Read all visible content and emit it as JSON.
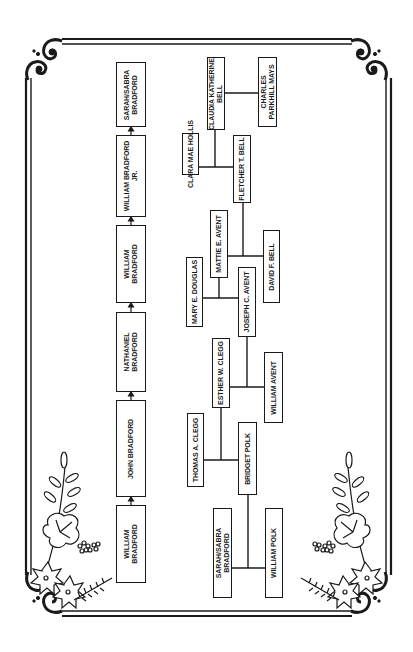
{
  "lineage_chain": {
    "direction": "bottom-to-top",
    "items": [
      {
        "label": "WILLIAM\nBRADFORD"
      },
      {
        "label": "JOHN BRADFORD"
      },
      {
        "label": "NATHANIEL\nBRADFORD"
      },
      {
        "label": "WILLIAM\nBRADFORD"
      },
      {
        "label": "WILLIAM BRADFORD\nJR."
      },
      {
        "label": "SARAH/SABRA\nBRADFORD"
      }
    ]
  },
  "family_tree": {
    "people": {
      "clara_mae_hollis": "CLARA MAE HOLLIS",
      "claudia_katherine_bell": "CLAUDIA KATHERINE\nBELL",
      "charles_parkhill_mays": "CHARLES\nPARKHILL MAYS",
      "fletcher_t_bell": "FLETCHER T. BELL",
      "mattie_e_avent": "MATTIE E. AVENT",
      "david_f_bell": "DAVID F. BELL",
      "mary_e_douglas": "MARY E. DOUGLAS",
      "joseph_c_avent": "JOSEPH C. AVENT",
      "esther_w_clegg": "ESTHER W. CLEGG",
      "william_avent": "WILLIAM AVENT",
      "thomas_a_clegg": "THOMAS A. CLEGG",
      "bridget_polk": "BRIDGET POLK",
      "sarah_sabra_bradford": "SARAH/SABRA\nBRADFORD",
      "william_polk": "WILLIAM POLK"
    },
    "couples": [
      {
        "a": "sarah_sabra_bradford",
        "b": "william_polk",
        "child": "bridget_polk"
      },
      {
        "a": "thomas_a_clegg",
        "b": "bridget_polk",
        "child": "esther_w_clegg"
      },
      {
        "a": "esther_w_clegg",
        "b": "william_avent",
        "child": "joseph_c_avent"
      },
      {
        "a": "mary_e_douglas",
        "b": "joseph_c_avent",
        "child": "mattie_e_avent"
      },
      {
        "a": "mattie_e_avent",
        "b": "david_f_bell",
        "child": "fletcher_t_bell"
      },
      {
        "a": "clara_mae_hollis",
        "b": "fletcher_t_bell",
        "child": "claudia_katherine_bell"
      },
      {
        "a": "claudia_katherine_bell",
        "b": "charles_parkhill_mays"
      }
    ]
  },
  "colors": {
    "ink": "#1a1a1a",
    "background": "#ffffff"
  }
}
